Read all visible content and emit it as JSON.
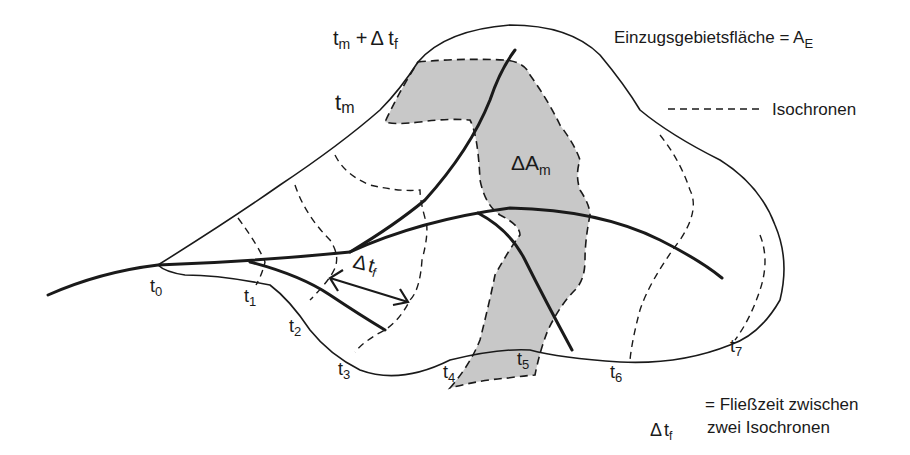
{
  "legend": {
    "area_label": "Einzugsgebietsfläche = A",
    "area_subscript": "E",
    "isochrone_sample": "---------",
    "isochrone_label": "Isochronen"
  },
  "labels": {
    "tm_plus": {
      "t": "t",
      "sub": "m",
      "plus": " +",
      "delta": "Δ",
      "t2": " t",
      "sub2": "f"
    },
    "tm": {
      "t": "t",
      "sub": "m"
    },
    "delta_am": {
      "delta": "Δ",
      "a": "A",
      "sub": "m"
    },
    "delta_tf_arrow": {
      "delta": "Δ",
      "t": "t",
      "sub": "f"
    },
    "time_marks": [
      {
        "t": "t",
        "sub": "0"
      },
      {
        "t": "t",
        "sub": "1"
      },
      {
        "t": "t",
        "sub": "2"
      },
      {
        "t": "t",
        "sub": "3"
      },
      {
        "t": "t",
        "sub": "4"
      },
      {
        "t": "t",
        "sub": "5"
      },
      {
        "t": "t",
        "sub": "6"
      },
      {
        "t": "t",
        "sub": "7"
      }
    ]
  },
  "definition": {
    "delta": "Δ",
    "t": "t",
    "sub": "f",
    "line1": "= Fließzeit zwischen",
    "line2": "zwei Isochronen"
  },
  "colors": {
    "line": "#1a1a1a",
    "shaded_area": "#c8c8c8",
    "background": "#ffffff"
  }
}
